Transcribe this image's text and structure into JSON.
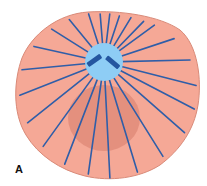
{
  "figure": {
    "panel_label": "A",
    "colors": {
      "cytoplasm": "#f5a896",
      "cell_outline": "#d98a78",
      "nucleus": "#e08c7a",
      "centrosome": "#8ecdf5",
      "microtubule": "#2f5ea8",
      "centriole": "#2456a0"
    },
    "microtubule_count": 24
  }
}
